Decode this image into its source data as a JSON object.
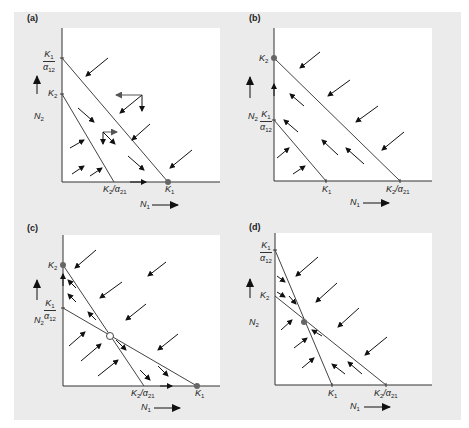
{
  "figure": {
    "colors": {
      "background": "#ffffff",
      "figure_panel": "#ebebeb",
      "plot_area": "#ffffff",
      "lines": "#444444",
      "arrows": "#111111",
      "equilibrium_dot": "#666666"
    },
    "axis_labels": {
      "x": "N1",
      "y": "N2"
    },
    "panels": [
      {
        "id": "a",
        "label": "(a)",
        "y_ticks": [
          "K1/α12",
          "K2"
        ],
        "x_ticks": [
          "K2/α21",
          "K1"
        ],
        "equilibria": [
          {
            "at": "K1 on N1 axis",
            "type": "stable (filled)"
          }
        ],
        "outcome": "Species 1 excludes species 2"
      },
      {
        "id": "b",
        "label": "(b)",
        "y_ticks": [
          "K2",
          "K1/α12"
        ],
        "x_ticks": [
          "K1",
          "K2/α21"
        ],
        "equilibria": [
          {
            "at": "K2 on N2 axis",
            "type": "stable (filled)"
          }
        ],
        "outcome": "Species 2 excludes species 1"
      },
      {
        "id": "c",
        "label": "(c)",
        "y_ticks": [
          "K2",
          "K1/α12"
        ],
        "x_ticks": [
          "K2/α21",
          "K1"
        ],
        "equilibria": [
          {
            "at": "K2 on N2 axis",
            "type": "stable (filled)"
          },
          {
            "at": "K1 on N1 axis",
            "type": "stable (filled)"
          },
          {
            "at": "isocline intersection",
            "type": "unstable (open)"
          }
        ],
        "outcome": "Unstable equilibrium; either species may win"
      },
      {
        "id": "d",
        "label": "(d)",
        "y_ticks": [
          "K1/α12",
          "K2"
        ],
        "x_ticks": [
          "K1",
          "K2/α21"
        ],
        "equilibria": [
          {
            "at": "isocline intersection",
            "type": "stable (filled)"
          }
        ],
        "outcome": "Stable coexistence"
      }
    ]
  }
}
